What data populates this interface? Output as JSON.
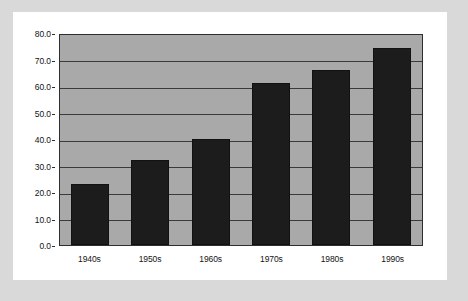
{
  "chart_data": {
    "type": "bar",
    "title": "",
    "subtitle": "",
    "xlabel": "",
    "ylabel": "",
    "categories": [
      "1940s",
      "1950s",
      "1960s",
      "1970s",
      "1980s",
      "1990s"
    ],
    "values": [
      23.0,
      32.0,
      40.0,
      61.0,
      66.0,
      74.5
    ],
    "series": [
      {
        "name": "",
        "values": [
          23.0,
          32.0,
          40.0,
          61.0,
          66.0,
          74.5
        ]
      }
    ],
    "ylim": [
      0.0,
      80.0
    ],
    "ytick_step": 10.0,
    "ytick_labels": [
      "0.0",
      "10.0",
      "20.0",
      "30.0",
      "40.0",
      "50.0",
      "60.0",
      "70.0",
      "80.0"
    ],
    "ytick_values": [
      0.0,
      10.0,
      20.0,
      30.0,
      40.0,
      50.0,
      60.0,
      70.0,
      80.0
    ],
    "grid": true,
    "grid_orientation": "horizontal",
    "legend": false,
    "legend_position": "none",
    "colors": {
      "bar": "#1c1c1c",
      "plot_background": "#a9a9a9",
      "gridline": "#3a3a3a",
      "axis": "#2e2e2e",
      "card_background": "#ffffff",
      "page_background": "#d9d9d9",
      "text": "#141414"
    }
  }
}
